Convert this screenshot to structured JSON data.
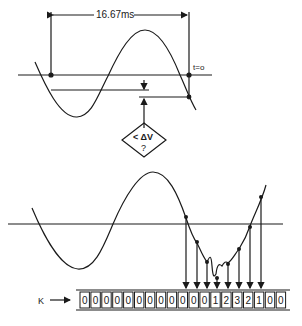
{
  "top_diagram": {
    "period_label": "16.67ms",
    "t0_label": "t=o",
    "decision_label_line1": "< ΔV",
    "decision_label_line2": "?"
  },
  "bottom_diagram": {
    "k_label": "K",
    "k_arrow": "⟶",
    "register_cells": [
      "0",
      "0",
      "0",
      "0",
      "0",
      "0",
      "0",
      "0",
      "0",
      "0",
      "0",
      "0",
      "1",
      "2",
      "3",
      "2",
      "1",
      "0",
      "0"
    ],
    "sample_arrow_count": 8
  },
  "colors": {
    "ink": "#1a1a1a",
    "background": "#ffffff"
  }
}
